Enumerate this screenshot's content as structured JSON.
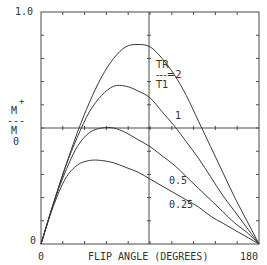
{
  "chart_data": {
    "type": "line",
    "title": "",
    "xlabel": "FLIP ANGLE (DEGREES)",
    "ylabel": "M+ / M0",
    "xlim": [
      0,
      180
    ],
    "ylim": [
      0,
      1.0
    ],
    "x_tick_labels": [
      "0",
      "180"
    ],
    "y_tick_labels": [
      "0",
      "1.0"
    ],
    "grid": false,
    "center_crosshair": true,
    "legend_label": "TR/T1",
    "x": [
      0,
      10,
      20,
      30,
      40,
      50,
      60,
      70,
      80,
      90,
      100,
      110,
      120,
      130,
      140,
      150,
      160,
      170,
      180
    ],
    "series": [
      {
        "name": "TR/T1=2",
        "label": "--=2",
        "values": [
          0,
          0.17,
          0.33,
          0.48,
          0.61,
          0.72,
          0.8,
          0.85,
          0.86,
          0.85,
          0.8,
          0.73,
          0.64,
          0.53,
          0.42,
          0.31,
          0.2,
          0.1,
          0
        ]
      },
      {
        "name": "TR/T1=1",
        "label": "1",
        "values": [
          0,
          0.17,
          0.33,
          0.46,
          0.57,
          0.64,
          0.68,
          0.68,
          0.66,
          0.63,
          0.57,
          0.51,
          0.44,
          0.37,
          0.29,
          0.21,
          0.14,
          0.07,
          0
        ]
      },
      {
        "name": "TR/T1=0.5",
        "label": "0.5",
        "values": [
          0,
          0.17,
          0.31,
          0.42,
          0.48,
          0.5,
          0.5,
          0.48,
          0.45,
          0.42,
          0.38,
          0.34,
          0.29,
          0.24,
          0.19,
          0.14,
          0.09,
          0.05,
          0
        ]
      },
      {
        "name": "TR/T1=0.25",
        "label": "0.25",
        "values": [
          0,
          0.16,
          0.28,
          0.34,
          0.36,
          0.36,
          0.35,
          0.33,
          0.31,
          0.28,
          0.25,
          0.22,
          0.19,
          0.16,
          0.12,
          0.09,
          0.06,
          0.03,
          0
        ]
      }
    ]
  },
  "labels": {
    "y_top": "1.0",
    "y_bottom": "0",
    "x_left": "0",
    "x_right": "180",
    "x_axis_title": "FLIP ANGLE (DEGREES)",
    "y_num": "M",
    "y_sup": "+",
    "y_bar": "---",
    "y_den": "M",
    "y_sub": "0",
    "legend_tr": "TR",
    "legend_eq": "---=2",
    "legend_t1": "T1",
    "curve_1": "1",
    "curve_05": "0.5",
    "curve_025": "0.25"
  },
  "colors": {
    "line": "#3a3a3a",
    "axis": "#4a4a4a",
    "background": "#ffffff"
  }
}
